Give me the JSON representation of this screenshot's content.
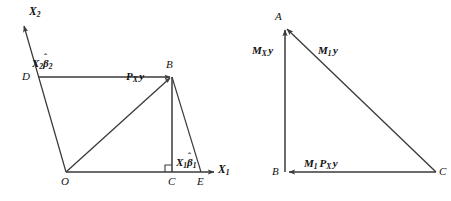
{
  "figure": {
    "background_color": "#ffffff",
    "stroke_color": "#3a3a3a",
    "text_color": "#111111"
  },
  "left_diagram": {
    "name": "projection-parallelogram",
    "axes": [
      {
        "id": "x1",
        "label": "X",
        "subscript": "1",
        "direction": "horizontal-right"
      },
      {
        "id": "x2",
        "label": "X",
        "subscript": "2",
        "direction": "up-left-diagonal"
      }
    ],
    "vertices": [
      {
        "id": "O",
        "label": "O"
      },
      {
        "id": "B",
        "label": "B"
      },
      {
        "id": "C",
        "label": "C"
      },
      {
        "id": "D",
        "label": "D"
      },
      {
        "id": "E",
        "label": "E"
      }
    ],
    "vector_labels": [
      {
        "id": "x2b2",
        "base": "X",
        "base_sub": "2",
        "greek": "β",
        "hat": "ˆ",
        "greek_sub": "2"
      },
      {
        "id": "pxy",
        "base": "P",
        "base_sub": "X",
        "tail": "y"
      },
      {
        "id": "x1b1",
        "base": "X",
        "base_sub": "1",
        "greek": "β",
        "hat": "ˆ",
        "greek_sub": "1"
      }
    ],
    "right_angle_marker_at": "C"
  },
  "right_diagram": {
    "name": "residual-triangle",
    "vertices": [
      {
        "id": "A",
        "label": "A"
      },
      {
        "id": "B",
        "label": "B"
      },
      {
        "id": "C",
        "label": "C"
      }
    ],
    "vector_labels": [
      {
        "id": "mxy",
        "base": "M",
        "base_sub": "X",
        "tail": "y"
      },
      {
        "id": "m1y",
        "base": "M",
        "base_sub": "1",
        "tail": "y"
      },
      {
        "id": "m1pxy",
        "base": "M",
        "base_sub": "1",
        "second": "P",
        "second_sub": "X",
        "tail": "y"
      }
    ]
  }
}
